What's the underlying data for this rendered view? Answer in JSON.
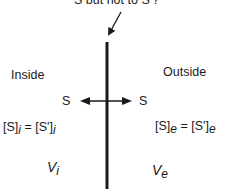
{
  "caption": "S but not to S'?",
  "regions": {
    "inside": {
      "label": "Inside"
    },
    "outside": {
      "label": "Outside"
    }
  },
  "species": {
    "left": "S",
    "right": "S"
  },
  "equations": {
    "inside": {
      "lhs": "[S]",
      "lhs_sub": "i",
      "eq": " = ",
      "rhs": "[S']",
      "rhs_sub": "i"
    },
    "outside": {
      "lhs": "[S]",
      "lhs_sub": "e",
      "eq": " = ",
      "rhs": "[S']",
      "rhs_sub": "e"
    }
  },
  "volumes": {
    "inside": {
      "symbol": "V",
      "sub": "i"
    },
    "outside": {
      "symbol": "V",
      "sub": "e"
    }
  },
  "colors": {
    "ink": "#1a1a1a",
    "background": "#ffffff"
  }
}
